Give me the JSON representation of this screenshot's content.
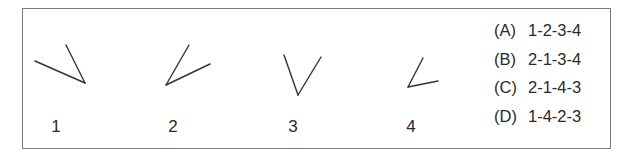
{
  "figures": [
    {
      "label": "1",
      "lines": [
        [
          35,
          61,
          85,
          83
        ],
        [
          66,
          45,
          85,
          83
        ]
      ],
      "label_x": 56
    },
    {
      "label": "2",
      "lines": [
        [
          166,
          85,
          189,
          45
        ],
        [
          166,
          85,
          210,
          64
        ]
      ],
      "label_x": 173
    },
    {
      "label": "3",
      "lines": [
        [
          298,
          95,
          284,
          55
        ],
        [
          298,
          95,
          321,
          57
        ]
      ],
      "label_x": 293
    },
    {
      "label": "4",
      "lines": [
        [
          408,
          87,
          423,
          58
        ],
        [
          408,
          87,
          438,
          81
        ]
      ],
      "label_x": 411
    }
  ],
  "options": [
    {
      "key": "(A)",
      "value": "1-2-3-4"
    },
    {
      "key": "(B)",
      "value": "2-1-3-4"
    },
    {
      "key": "(C)",
      "value": "2-1-4-3"
    },
    {
      "key": "(D)",
      "value": "1-4-2-3"
    }
  ],
  "colors": {
    "stroke": "#333333",
    "border": "#7a7a7a"
  }
}
